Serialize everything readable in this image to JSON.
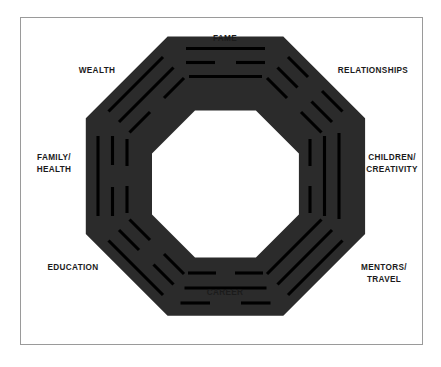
{
  "diagram": {
    "frame": {
      "border_color": "#9a9a9a",
      "background_color": "#ffffff"
    },
    "octagon": {
      "fill_color": "#2b2b2b",
      "line_color": "#000000",
      "shape": "octagon-ring"
    },
    "sectors": [
      {
        "id": "fame",
        "label": "FAME",
        "position": "top",
        "trigram_name": "li",
        "trigram_element": "Fire",
        "lines": [
          "solid",
          "broken",
          "solid"
        ]
      },
      {
        "id": "relationships",
        "label": "RELATIONSHIPS",
        "position": "top-right",
        "trigram_name": "kun",
        "trigram_element": "Earth",
        "lines": [
          "broken",
          "broken",
          "broken"
        ]
      },
      {
        "id": "children-creativity",
        "label": "CHILDREN/\nCREATIVITY",
        "position": "right",
        "trigram_name": "dui",
        "trigram_element": "Lake",
        "lines": [
          "broken",
          "solid",
          "solid"
        ]
      },
      {
        "id": "mentors-travel",
        "label": "MENTORS/\nTRAVEL",
        "position": "bottom-right",
        "trigram_name": "qian",
        "trigram_element": "Heaven",
        "lines": [
          "solid",
          "solid",
          "solid"
        ]
      },
      {
        "id": "career",
        "label": "CAREER",
        "position": "bottom",
        "trigram_name": "kan",
        "trigram_element": "Water",
        "lines": [
          "broken",
          "solid",
          "broken"
        ]
      },
      {
        "id": "education",
        "label": "EDUCATION",
        "position": "bottom-left",
        "trigram_name": "gen",
        "trigram_element": "Mountain",
        "lines": [
          "broken",
          "broken",
          "solid"
        ]
      },
      {
        "id": "family-health",
        "label": "FAMILY/\nHEALTH",
        "position": "left",
        "trigram_name": "zhen",
        "trigram_element": "Thunder",
        "lines": [
          "solid",
          "broken",
          "broken"
        ]
      },
      {
        "id": "wealth",
        "label": "WEALTH",
        "position": "top-left",
        "trigram_name": "xun",
        "trigram_element": "Wind",
        "lines": [
          "solid",
          "solid",
          "broken"
        ]
      }
    ]
  }
}
